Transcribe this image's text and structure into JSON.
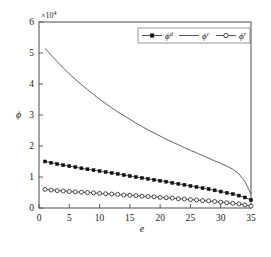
{
  "chart_data": {
    "type": "line",
    "title": "",
    "subtitle": "",
    "xlabel": "e",
    "ylabel": "ϕ",
    "y_multiplier_label": "×10",
    "y_multiplier_exponent": "4",
    "y_multiplier_value": 10000,
    "xlim": [
      0,
      35
    ],
    "ylim": [
      0,
      6
    ],
    "xticks": [
      0,
      5,
      10,
      15,
      20,
      25,
      30,
      35
    ],
    "xtick_labels": [
      "0",
      "5",
      "10",
      "15",
      "20",
      "25",
      "30",
      "35"
    ],
    "yticks": [
      0,
      1,
      2,
      3,
      4,
      5,
      6
    ],
    "ytick_labels": [
      "0",
      "1",
      "2",
      "3",
      "4",
      "5",
      "6"
    ],
    "grid": false,
    "legend_position": "top-right",
    "x": [
      1,
      2,
      3,
      4,
      5,
      6,
      7,
      8,
      9,
      10,
      11,
      12,
      13,
      14,
      15,
      16,
      17,
      18,
      19,
      20,
      21,
      22,
      23,
      24,
      25,
      26,
      27,
      28,
      29,
      30,
      31,
      32,
      33,
      34,
      35
    ],
    "series": [
      {
        "name": "ϕ",
        "superscript": "d",
        "legend_label": "ϕᵈ",
        "marker": "filled-square",
        "line_style": "solid",
        "color": "#111111",
        "values": [
          1.5,
          1.46,
          1.42,
          1.38,
          1.35,
          1.32,
          1.28,
          1.25,
          1.22,
          1.19,
          1.16,
          1.13,
          1.1,
          1.06,
          1.03,
          1.0,
          0.97,
          0.94,
          0.91,
          0.88,
          0.85,
          0.81,
          0.78,
          0.75,
          0.71,
          0.68,
          0.64,
          0.61,
          0.57,
          0.53,
          0.49,
          0.45,
          0.4,
          0.34,
          0.26
        ]
      },
      {
        "name": "ϕ",
        "superscript": "c",
        "legend_label": "ϕᶜ",
        "marker": "none",
        "line_style": "solid",
        "color": "#3a3a3a",
        "values": [
          5.15,
          4.93,
          4.72,
          4.52,
          4.33,
          4.15,
          3.98,
          3.82,
          3.66,
          3.51,
          3.37,
          3.23,
          3.1,
          2.98,
          2.86,
          2.74,
          2.63,
          2.52,
          2.42,
          2.32,
          2.22,
          2.13,
          2.04,
          1.95,
          1.86,
          1.78,
          1.69,
          1.61,
          1.52,
          1.44,
          1.35,
          1.25,
          1.1,
          0.85,
          0.45
        ]
      },
      {
        "name": "ϕ",
        "superscript": "r",
        "legend_label": "ϕʳ",
        "marker": "open-circle",
        "line_style": "solid",
        "color": "#1f1f1f",
        "values": [
          0.6,
          0.58,
          0.56,
          0.55,
          0.53,
          0.52,
          0.51,
          0.5,
          0.49,
          0.47,
          0.46,
          0.45,
          0.44,
          0.42,
          0.41,
          0.4,
          0.38,
          0.37,
          0.36,
          0.34,
          0.33,
          0.32,
          0.3,
          0.29,
          0.27,
          0.26,
          0.24,
          0.23,
          0.21,
          0.19,
          0.17,
          0.15,
          0.13,
          0.1,
          0.06
        ]
      }
    ]
  },
  "axes": {
    "y_multiplier_prefix": "×10",
    "y_multiplier_exp": "4",
    "x_axis_title": "e",
    "y_axis_title": "ϕ"
  }
}
